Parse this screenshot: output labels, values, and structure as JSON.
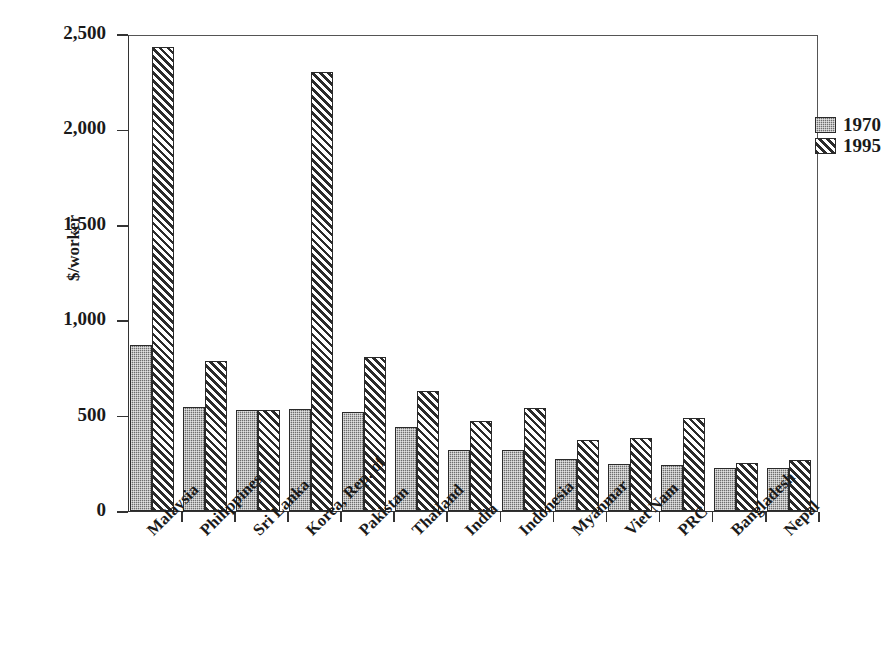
{
  "chart_data": {
    "type": "bar",
    "title": "",
    "subtitle": "",
    "xlabel": "",
    "ylabel": "$/worker",
    "ylim": [
      0,
      2500
    ],
    "ytick_labels": [
      "0",
      "500",
      "1,000",
      "1,500",
      "2,000",
      "2,500"
    ],
    "ytick_values": [
      0,
      500,
      1000,
      1500,
      2000,
      2500
    ],
    "grid": false,
    "legend_position": "top-right",
    "categories": [
      "Malaysia",
      "Philippines",
      "Sri Lanka",
      "Korea, Rep. of",
      "Pakistan",
      "Thailand",
      "India",
      "Indonesia",
      "Myanmar",
      "Viet Nam",
      "PRC",
      "Bangladesh",
      "Nepal"
    ],
    "series": [
      {
        "name": "1970",
        "pattern": "checker-gray",
        "color": "#6e6e6e",
        "values": [
          870,
          545,
          530,
          535,
          518,
          440,
          320,
          320,
          272,
          245,
          243,
          228,
          228
        ]
      },
      {
        "name": "1995",
        "pattern": "diagonal-hatch",
        "color": "#2b2b2b",
        "values": [
          2432,
          785,
          528,
          2300,
          807,
          629,
          470,
          540,
          370,
          385,
          487,
          253,
          268
        ]
      }
    ]
  },
  "legend": {
    "entries": [
      {
        "label": "1970"
      },
      {
        "label": "1995"
      }
    ]
  },
  "axis": {
    "y_label": "$/worker"
  }
}
